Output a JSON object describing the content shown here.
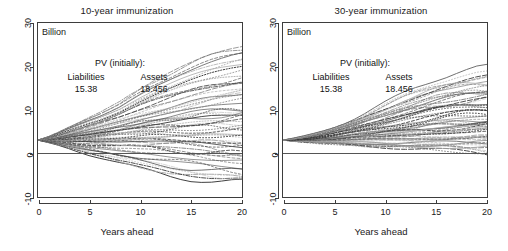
{
  "figure": {
    "unit_label": "Billion",
    "xlabel": "Years ahead",
    "panels": [
      {
        "id": "panel-10-year",
        "title": "10-year immunization",
        "pv_header": "PV (initially):",
        "pv_col1_label": "Liabilities",
        "pv_col2_label": "Assets",
        "pv_col1_value": "15.38",
        "pv_col2_value": "18.456"
      },
      {
        "id": "panel-30-year",
        "title": "30-year immunization",
        "pv_header": "PV (initially):",
        "pv_col1_label": "Liabilities",
        "pv_col2_label": "Assets",
        "pv_col1_value": "15.38",
        "pv_col2_value": "18.456"
      }
    ]
  },
  "axes": {
    "y_ticks": [
      "30",
      "20",
      "10",
      "0",
      "-10"
    ],
    "x_ticks": [
      "0",
      "5",
      "10",
      "15",
      "20"
    ],
    "ylim": [
      -10,
      30
    ],
    "xlim": [
      0,
      20
    ]
  },
  "colors": {
    "frame": "#3d3d3d",
    "text": "#1a1a1a",
    "line_dark": "#2b2b2b",
    "line_mid": "#6e6e6e",
    "line_light": "#a8a8a8",
    "zero_line": "#555555",
    "background": "#ffffff"
  },
  "chart_data": {
    "type": "line",
    "xlabel": "Years ahead",
    "ylabel": "Billion",
    "xlim": [
      0,
      20
    ],
    "ylim": [
      -10,
      30
    ],
    "grid": false,
    "legend": "none",
    "x": [
      0,
      1,
      2,
      3,
      4,
      5,
      6,
      7,
      8,
      9,
      10,
      11,
      12,
      13,
      14,
      15,
      16,
      17,
      18,
      19,
      20
    ],
    "annotations": [
      "Billion",
      "PV (initially): Liabilities 15.38  Assets 18.456"
    ],
    "panels": [
      {
        "name": "10-year immunization",
        "start_value": 3.08,
        "n_series": 60,
        "description": "Fan of simulated surplus trajectories diverging from ~3.1 Billion at year 0; spread at year 20 ranges from about -7 to +25 Billion. Mixture of solid, dashed and dotted grey/black lines. A solid horizontal reference line is drawn at 0.",
        "envelope": {
          "max": [
            3.08,
            3.9,
            5.0,
            6.2,
            7.3,
            8.4,
            9.4,
            10.6,
            11.9,
            13.6,
            15.2,
            16.6,
            17.8,
            18.9,
            20.0,
            21.0,
            22.0,
            22.9,
            23.7,
            24.4,
            25.0
          ],
          "q75": [
            3.08,
            3.5,
            4.0,
            4.6,
            5.2,
            5.8,
            6.4,
            7.1,
            7.8,
            8.6,
            9.4,
            10.1,
            10.8,
            11.4,
            12.0,
            12.6,
            13.1,
            13.6,
            14.0,
            14.4,
            14.8
          ],
          "median": [
            3.08,
            3.2,
            3.4,
            3.6,
            3.8,
            4.0,
            4.3,
            4.6,
            4.9,
            5.2,
            5.5,
            5.8,
            6.0,
            6.2,
            6.4,
            6.6,
            6.8,
            7.0,
            7.1,
            7.2,
            7.3
          ],
          "q25": [
            3.08,
            3.0,
            2.9,
            2.8,
            2.7,
            2.7,
            2.6,
            2.6,
            2.5,
            2.5,
            2.4,
            2.4,
            2.3,
            2.2,
            2.1,
            2.0,
            1.9,
            1.7,
            1.5,
            1.3,
            1.1
          ],
          "min": [
            3.08,
            2.5,
            1.9,
            1.2,
            0.4,
            -0.4,
            -1.1,
            -1.8,
            -2.5,
            -3.1,
            -3.7,
            -4.2,
            -4.7,
            -5.2,
            -5.6,
            -6.0,
            -6.3,
            -6.6,
            -6.8,
            -6.9,
            -7.0
          ]
        }
      },
      {
        "name": "30-year immunization",
        "start_value": 3.08,
        "n_series": 60,
        "description": "Fan of simulated surplus trajectories all remaining positive; narrower spread than the 10-year panel, reaching about 0.5 to 19 Billion at year 20. A solid horizontal reference line is drawn at 0.",
        "envelope": {
          "max": [
            3.08,
            3.5,
            4.0,
            4.6,
            5.3,
            6.1,
            7.0,
            8.0,
            9.1,
            10.3,
            11.5,
            12.7,
            13.9,
            15.0,
            16.0,
            16.9,
            17.6,
            18.2,
            18.6,
            18.9,
            19.0
          ],
          "q75": [
            3.08,
            3.3,
            3.6,
            4.0,
            4.4,
            4.9,
            5.5,
            6.1,
            6.8,
            7.5,
            8.2,
            8.9,
            9.6,
            10.2,
            10.8,
            11.3,
            11.7,
            12.1,
            12.4,
            12.6,
            12.8
          ],
          "median": [
            3.08,
            3.1,
            3.2,
            3.3,
            3.5,
            3.7,
            4.0,
            4.3,
            4.6,
            4.9,
            5.3,
            5.6,
            5.9,
            6.2,
            6.5,
            6.7,
            6.9,
            7.1,
            7.2,
            7.3,
            7.4
          ],
          "q25": [
            3.08,
            3.0,
            3.0,
            3.0,
            3.0,
            3.0,
            3.1,
            3.2,
            3.3,
            3.4,
            3.5,
            3.6,
            3.7,
            3.8,
            3.9,
            4.0,
            4.0,
            4.1,
            4.1,
            4.2,
            4.2
          ],
          "min": [
            3.08,
            2.8,
            2.6,
            2.4,
            2.2,
            2.1,
            1.9,
            1.8,
            1.6,
            1.5,
            1.4,
            1.3,
            1.2,
            1.1,
            1.0,
            0.9,
            0.8,
            0.7,
            0.6,
            0.55,
            0.5
          ]
        }
      }
    ],
    "reference_line": {
      "y": 0,
      "style": "solid"
    }
  }
}
